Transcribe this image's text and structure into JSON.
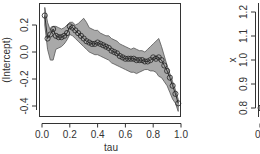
{
  "chart_data": [
    {
      "type": "line",
      "title": "",
      "xlabel": "tau",
      "ylabel": "(Intercept)",
      "xlim": [
        0.0,
        1.0
      ],
      "ylim": [
        -0.45,
        0.36
      ],
      "xticks": [
        "0.0",
        "0.2",
        "0.4",
        "0.6",
        "0.8",
        "1.0"
      ],
      "yticks": [
        "-0.4",
        "-0.2",
        "0.0",
        "0.2"
      ],
      "grid": false,
      "legend": null,
      "series": [
        {
          "name": "estimate",
          "marker": "circle",
          "x": [
            0.02,
            0.04,
            0.06,
            0.08,
            0.1,
            0.12,
            0.14,
            0.16,
            0.18,
            0.2,
            0.22,
            0.24,
            0.26,
            0.28,
            0.3,
            0.32,
            0.34,
            0.36,
            0.38,
            0.4,
            0.42,
            0.44,
            0.46,
            0.48,
            0.5,
            0.52,
            0.54,
            0.56,
            0.58,
            0.6,
            0.62,
            0.64,
            0.66,
            0.68,
            0.7,
            0.72,
            0.74,
            0.76,
            0.78,
            0.8,
            0.82,
            0.84,
            0.86,
            0.88,
            0.9,
            0.92,
            0.94,
            0.96,
            0.98
          ],
          "values": [
            0.27,
            0.1,
            0.13,
            0.17,
            0.12,
            0.11,
            0.11,
            0.12,
            0.14,
            0.19,
            0.18,
            0.16,
            0.14,
            0.12,
            0.1,
            0.08,
            0.07,
            0.06,
            0.06,
            0.07,
            0.06,
            0.05,
            0.04,
            0.03,
            0.01,
            0.0,
            -0.01,
            -0.03,
            -0.04,
            -0.05,
            -0.05,
            -0.05,
            -0.05,
            -0.06,
            -0.06,
            -0.06,
            -0.07,
            -0.07,
            -0.06,
            -0.04,
            -0.05,
            -0.04,
            -0.06,
            -0.1,
            -0.14,
            -0.19,
            -0.25,
            -0.31,
            -0.38
          ]
        },
        {
          "name": "confidence band",
          "type": "area",
          "x": [
            0.02,
            0.04,
            0.06,
            0.08,
            0.1,
            0.12,
            0.14,
            0.16,
            0.18,
            0.2,
            0.22,
            0.24,
            0.26,
            0.28,
            0.3,
            0.32,
            0.34,
            0.36,
            0.38,
            0.4,
            0.42,
            0.44,
            0.46,
            0.48,
            0.5,
            0.52,
            0.54,
            0.56,
            0.58,
            0.6,
            0.62,
            0.64,
            0.66,
            0.68,
            0.7,
            0.72,
            0.74,
            0.76,
            0.78,
            0.8,
            0.82,
            0.84,
            0.86,
            0.88,
            0.9,
            0.92,
            0.94,
            0.96,
            0.98
          ],
          "upper": [
            0.33,
            0.22,
            0.16,
            0.19,
            0.19,
            0.18,
            0.17,
            0.18,
            0.2,
            0.22,
            0.22,
            0.2,
            0.21,
            0.23,
            0.25,
            0.22,
            0.18,
            0.17,
            0.16,
            0.16,
            0.14,
            0.13,
            0.12,
            0.12,
            0.1,
            0.09,
            0.08,
            0.06,
            0.05,
            0.04,
            0.03,
            0.02,
            0.03,
            0.02,
            0.01,
            0.01,
            0.0,
            0.02,
            0.04,
            0.06,
            0.08,
            0.1,
            0.04,
            -0.03,
            -0.1,
            -0.16,
            -0.22,
            -0.28,
            -0.35
          ],
          "lower": [
            0.2,
            0.02,
            -0.06,
            -0.06,
            0.02,
            0.03,
            0.04,
            0.06,
            0.09,
            0.13,
            0.12,
            0.1,
            0.08,
            0.06,
            0.04,
            0.02,
            0.0,
            -0.01,
            -0.02,
            -0.02,
            -0.03,
            -0.04,
            -0.05,
            -0.06,
            -0.08,
            -0.09,
            -0.1,
            -0.11,
            -0.12,
            -0.13,
            -0.14,
            -0.15,
            -0.15,
            -0.16,
            -0.15,
            -0.14,
            -0.13,
            -0.13,
            -0.14,
            -0.14,
            -0.15,
            -0.18,
            -0.19,
            -0.22,
            -0.25,
            -0.3,
            -0.35,
            -0.38,
            -0.44
          ]
        }
      ]
    },
    {
      "type": "line",
      "title": "",
      "xlabel": "",
      "ylabel": "x",
      "ylim": [
        0.77,
        1.25
      ],
      "xticks": [
        "0.0"
      ],
      "yticks": [
        "0.8",
        "0.9",
        "1.0",
        "1.1",
        "1.2"
      ],
      "partial": true,
      "series": [
        {
          "name": "estimate",
          "x": [
            0.02
          ],
          "values": [
            0.8
          ]
        }
      ]
    }
  ],
  "plot1": {
    "ylabel": "(Intercept)",
    "xlabel": "tau",
    "xticks": [
      "0.0",
      "0.2",
      "0.4",
      "0.6",
      "0.8",
      "1.0"
    ],
    "yticks": [
      "-0.4",
      "-0.2",
      "0.0",
      "0.2"
    ]
  },
  "plot2": {
    "ylabel": "x",
    "xticks": [
      "0.0"
    ],
    "yticks": [
      "0.8",
      "0.9",
      "1.0",
      "1.1",
      "1.2"
    ]
  },
  "colors": {
    "band_fill": "#a9a9a9",
    "band_edge": "#555555",
    "line": "#222222",
    "marker_edge": "#222222",
    "axis": "#333333"
  }
}
